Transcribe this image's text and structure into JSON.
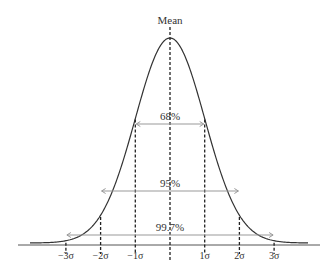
{
  "title": "Mean",
  "intervals": [
    {
      "label": "68%",
      "from": -1,
      "to": 1
    },
    {
      "label": "95%",
      "from": -2,
      "to": 2
    },
    {
      "label": "99.7%",
      "from": -3,
      "to": 3
    }
  ],
  "axis_ticks": [
    "−3σ",
    "−2σ",
    "−1σ",
    "1σ",
    "2σ",
    "3σ"
  ],
  "colors": {
    "curve": "#333333",
    "arrow": "#999999",
    "dash": "#222222"
  }
}
